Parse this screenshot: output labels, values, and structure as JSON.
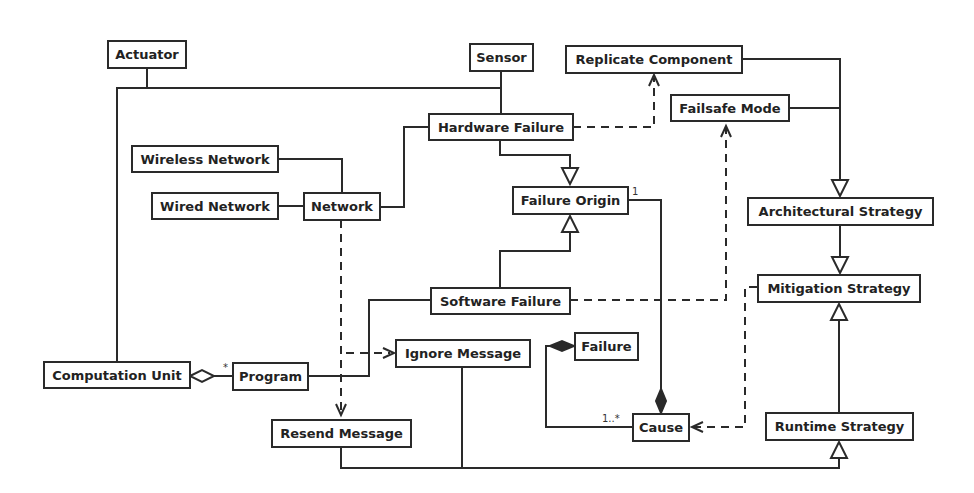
{
  "diagram": {
    "type": "UML class diagram",
    "classes": {
      "actuator": "Actuator",
      "sensor": "Sensor",
      "replicate_component": "Replicate Component",
      "failsafe_mode": "Failsafe Mode",
      "hardware_failure": "Hardware Failure",
      "wireless_network": "Wireless Network",
      "wired_network": "Wired Network",
      "network": "Network",
      "failure_origin": "Failure Origin",
      "architectural_strategy": "Architectural Strategy",
      "software_failure": "Software Failure",
      "mitigation_strategy": "Mitigation Strategy",
      "ignore_message": "Ignore Message",
      "failure": "Failure",
      "computation_unit": "Computation Unit",
      "program": "Program",
      "resend_message": "Resend Message",
      "cause": "Cause",
      "runtime_strategy": "Runtime Strategy"
    },
    "multiplicities": {
      "program_star": "*",
      "failure_origin_one": "1",
      "cause_one_many": "1..*"
    },
    "relations": [
      {
        "from": "Actuator",
        "to": "Sensor",
        "kind": "association"
      },
      {
        "from": "Computation Unit",
        "to": "Sensor",
        "kind": "association"
      },
      {
        "from": "Sensor",
        "to": "Hardware Failure",
        "kind": "association"
      },
      {
        "from": "Hardware Failure",
        "to": "Replicate Component",
        "kind": "dependency"
      },
      {
        "from": "Hardware Failure",
        "to": "Failure Origin",
        "kind": "generalization"
      },
      {
        "from": "Software Failure",
        "to": "Failure Origin",
        "kind": "generalization"
      },
      {
        "from": "Software Failure",
        "to": "Failsafe Mode",
        "kind": "dependency"
      },
      {
        "from": "Wireless Network",
        "to": "Network",
        "kind": "association"
      },
      {
        "from": "Wired Network",
        "to": "Network",
        "kind": "association"
      },
      {
        "from": "Network",
        "to": "Hardware Failure",
        "kind": "association"
      },
      {
        "from": "Network",
        "to": "Ignore Message",
        "kind": "dependency"
      },
      {
        "from": "Network",
        "to": "Resend Message",
        "kind": "dependency"
      },
      {
        "from": "Program",
        "to": "Computation Unit",
        "kind": "aggregation",
        "multiplicity": "*"
      },
      {
        "from": "Program",
        "to": "Software Failure",
        "kind": "association"
      },
      {
        "from": "Replicate Component",
        "to": "Architectural Strategy",
        "kind": "generalization"
      },
      {
        "from": "Failsafe Mode",
        "to": "Architectural Strategy",
        "kind": "generalization"
      },
      {
        "from": "Architectural Strategy",
        "to": "Mitigation Strategy",
        "kind": "generalization"
      },
      {
        "from": "Runtime Strategy",
        "to": "Mitigation Strategy",
        "kind": "generalization"
      },
      {
        "from": "Resend Message",
        "to": "Runtime Strategy",
        "kind": "generalization"
      },
      {
        "from": "Ignore Message",
        "to": "Runtime Strategy",
        "kind": "generalization"
      },
      {
        "from": "Mitigation Strategy",
        "to": "Cause",
        "kind": "dependency"
      },
      {
        "from": "Failure Origin",
        "to": "Cause",
        "kind": "composition",
        "multiplicity": "1"
      },
      {
        "from": "Cause",
        "to": "Failure",
        "kind": "composition",
        "multiplicity": "1..*"
      }
    ]
  }
}
